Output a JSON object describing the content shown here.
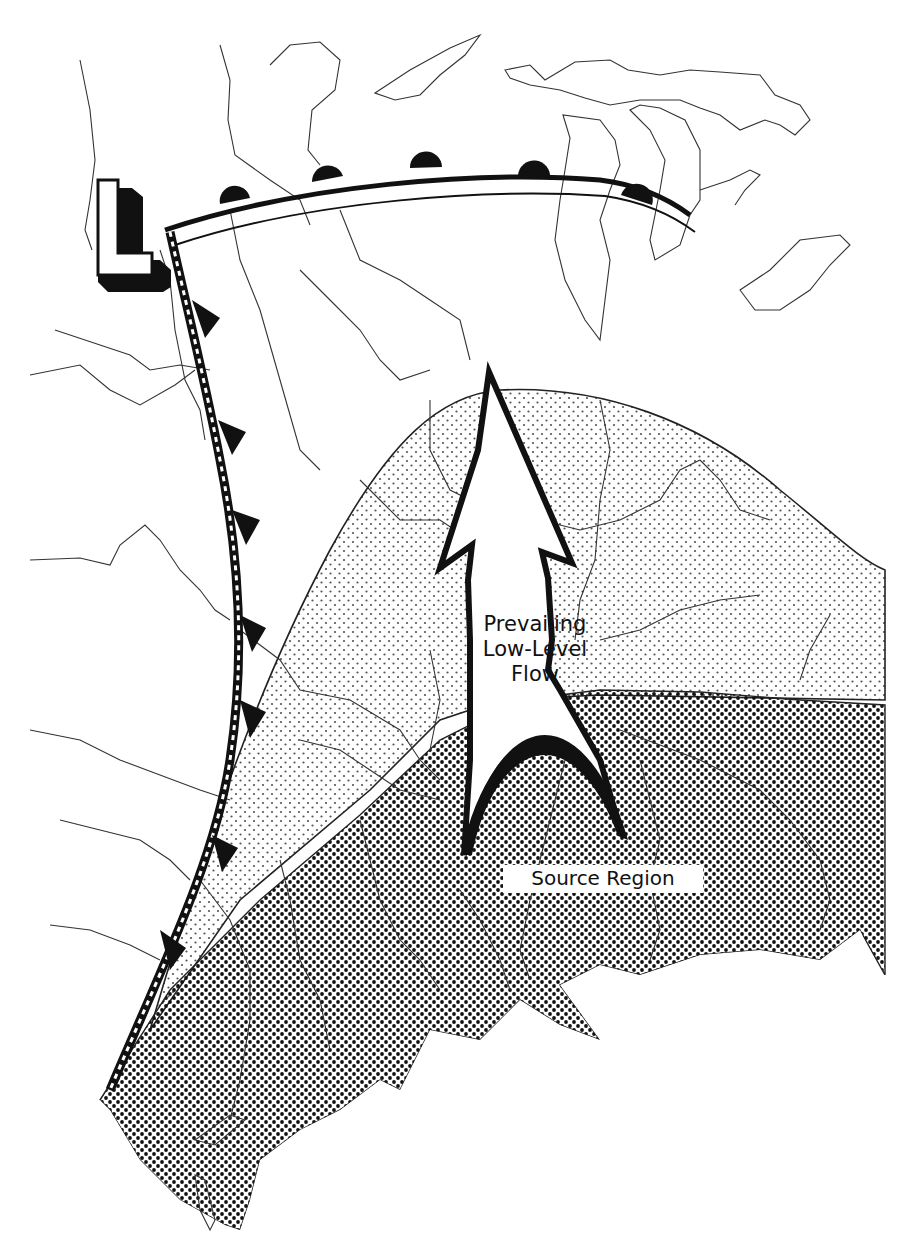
{
  "figure": {
    "type": "weather-map-schematic",
    "colors": {
      "background": "#ffffff",
      "ink": "#111111",
      "boundary_lines": "#444444",
      "light_stipple": "#555555",
      "dense_stipple": "#111111"
    }
  },
  "symbols": {
    "low_pressure": {
      "label": "L",
      "icon": "low-pressure-icon"
    },
    "warm_front": {
      "icon": "warm-front-icon",
      "semicircle_count": 5
    },
    "cold_front": {
      "icon": "cold-front-icon",
      "triangle_count": 7
    },
    "flow_arrow": {
      "icon": "flow-arrow-icon",
      "direction": "north"
    }
  },
  "labels": {
    "flow": [
      "Prevailing",
      "Low-Level",
      "Flow"
    ],
    "source": "Source Region"
  },
  "regions": {
    "moist_region": {
      "pattern": "light-stipple"
    },
    "source_region": {
      "pattern": "dense-stipple"
    }
  }
}
